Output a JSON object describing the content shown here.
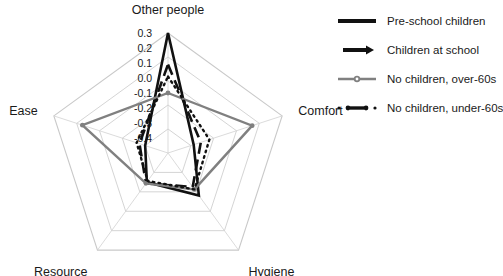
{
  "chart_data": {
    "type": "line",
    "subtype": "radar",
    "title": "",
    "xlabel": "",
    "ylabel": "",
    "categories": [
      "Other people",
      "Comfort",
      "Hygiene",
      "Resource",
      "Ease"
    ],
    "tick_labels": [
      "0.3",
      "0.2",
      "0.1",
      "0.0",
      "-0.1",
      "-0.2",
      "-0.3",
      "-0.4"
    ],
    "tick_values": [
      0.3,
      0.2,
      0.1,
      0.0,
      -0.1,
      -0.2,
      -0.3,
      -0.4
    ],
    "rlim": [
      -0.5,
      0.3
    ],
    "grid": true,
    "legend_position": "right",
    "series": [
      {
        "name": "Pre-school children",
        "color": "#111111",
        "style": "solid",
        "width": 2.6,
        "values": [
          0.3,
          -0.32,
          -0.15,
          -0.26,
          -0.34
        ]
      },
      {
        "name": "Children at school",
        "color": "#111111",
        "style": "dashed",
        "width": 2.6,
        "values": [
          0.09,
          -0.27,
          -0.22,
          -0.25,
          -0.3
        ]
      },
      {
        "name": "No children, over-60s",
        "color": "#808080",
        "style": "solid",
        "width": 2.4,
        "values": [
          -0.1,
          0.09,
          -0.2,
          -0.25,
          0.1
        ]
      },
      {
        "name": "No children, under-60s",
        "color": "#111111",
        "style": "dotted",
        "width": 2.4,
        "values": [
          0.01,
          -0.21,
          -0.2,
          -0.27,
          -0.28
        ]
      }
    ]
  },
  "chart": {
    "center_x": 168,
    "center_y": 153,
    "radius": 120,
    "ring_count": 5,
    "grid_color": "#c9c9c9",
    "spoke_color": "#d2d2d2",
    "axis_label_offset": 17
  },
  "legend": {
    "items": [
      {
        "label": "Pre-school children",
        "key": "solid-thick-line-key",
        "color": "#111111",
        "style": "solid"
      },
      {
        "label": "Children at school",
        "key": "arrow-dash-line-key",
        "color": "#111111",
        "style": "dashed"
      },
      {
        "label": "No children, over-60s",
        "key": "gray-marker-line-key",
        "color": "#808080",
        "style": "solid"
      },
      {
        "label": "No children, under-60s",
        "key": "dotted-marker-line-key",
        "color": "#111111",
        "style": "dotted"
      }
    ]
  }
}
